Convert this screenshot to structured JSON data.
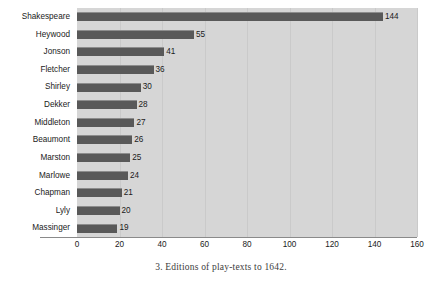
{
  "chart_data": {
    "type": "bar",
    "orientation": "horizontal",
    "title": "",
    "caption": "3. Editions of play-texts to 1642.",
    "categories": [
      "Shakespeare",
      "Heywood",
      "Jonson",
      "Fletcher",
      "Shirley",
      "Dekker",
      "Middleton",
      "Beaumont",
      "Marston",
      "Marlowe",
      "Chapman",
      "Lyly",
      "Massinger"
    ],
    "values": [
      144,
      55,
      41,
      36,
      30,
      28,
      27,
      26,
      25,
      24,
      21,
      20,
      19
    ],
    "value_labels": [
      "144",
      "55",
      "41",
      "36",
      "30",
      "28",
      "27",
      "26",
      "25",
      "24",
      "21",
      "20",
      "19"
    ],
    "xlabel": "",
    "ylabel": "",
    "xlim": [
      0,
      160
    ],
    "xticks": [
      0,
      20,
      40,
      60,
      80,
      100,
      120,
      140,
      160
    ],
    "xtick_labels": [
      "0",
      "20",
      "40",
      "60",
      "80",
      "100",
      "120",
      "140",
      "160"
    ],
    "grid": "vertical",
    "legend": "none",
    "colors": {
      "bar_fill": "#595959",
      "bar_highlight": "#8d8d8d",
      "panel_background": "#d6d6d6",
      "gridline": "#cacaca",
      "axis_line": "#8a8a8a",
      "text": "#1a1a1a",
      "caption_text": "#3c3c3c",
      "figure_background": "#ffffff"
    }
  }
}
